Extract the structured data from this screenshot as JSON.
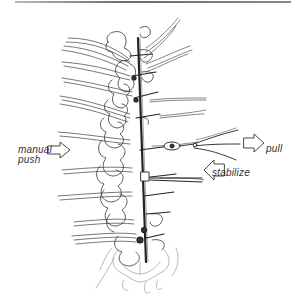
{
  "figure": {
    "labels": {
      "manual": "manual",
      "push": "push",
      "pull": "pull",
      "stabilize": "stabilize"
    },
    "arrows": [
      {
        "name": "manual-push-arrow",
        "direction": "right"
      },
      {
        "name": "pull-arrow",
        "direction": "right"
      },
      {
        "name": "stabilize-arrow",
        "direction": "left"
      }
    ],
    "colors": {
      "ink": "#2a2a2a",
      "light_ink": "#9a9a9a",
      "background": "#ffffff"
    }
  }
}
